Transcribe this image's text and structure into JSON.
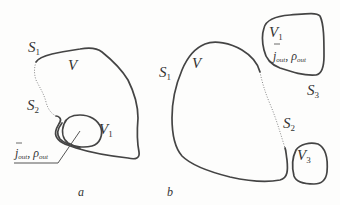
{
  "figure": {
    "panels": [
      {
        "id": "a",
        "caption": "a",
        "labels": {
          "surface1": "S",
          "surface1_sub": "1",
          "surface2": "S",
          "surface2_sub": "2",
          "volume": "V",
          "inner_volume": "V",
          "inner_volume_sub": "1",
          "current": "j",
          "current_sub": "out",
          "separator": ",",
          "density": "ρ",
          "density_sub": "out"
        }
      },
      {
        "id": "b",
        "caption": "b",
        "labels": {
          "surface1": "S",
          "surface1_sub": "1",
          "surface2": "S",
          "surface2_sub": "2",
          "surface3": "S",
          "surface3_sub": "3",
          "volume": "V",
          "volume1": "V",
          "volume1_sub": "1",
          "volume3": "V",
          "volume3_sub": "3",
          "current": "j",
          "current_sub": "out",
          "separator": ",",
          "density": "ρ",
          "density_sub": "out"
        }
      }
    ]
  }
}
